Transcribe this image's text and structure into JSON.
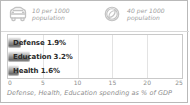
{
  "card": {
    "border_color": "#b9b9b9",
    "background": "#ffffff"
  },
  "legend": {
    "items": [
      {
        "icon": "car-icon",
        "line1": "10 per 1000",
        "line2": "population",
        "value": 10,
        "unit": "per 1000 population"
      },
      {
        "icon": "circle-slash-icon",
        "line1": "40 per 1000",
        "line2": "population",
        "value": 40,
        "unit": "per 1000 population"
      }
    ],
    "text_color": "#9b9b9b"
  },
  "caption": "Defense, Health, Education spending as % of GDP",
  "chart_data": {
    "type": "bar",
    "orientation": "horizontal",
    "title": "",
    "subtitle": "",
    "xlabel": "",
    "ylabel": "",
    "categories": [
      "Defense",
      "Education",
      "Health"
    ],
    "values": [
      1.9,
      3.2,
      1.6
    ],
    "value_suffix": "%",
    "bar_labels": [
      "Defense 1.9%",
      "Education 3.2%",
      "Health 1.6%"
    ],
    "xlim": [
      0,
      25
    ],
    "xticks": [
      0,
      5,
      10,
      15,
      20,
      25
    ],
    "xtick_labels": [
      "0",
      "5",
      "10",
      "15",
      "20",
      "25"
    ],
    "grid": true,
    "gridline_color": "#e3e3e3",
    "legend_position": "top",
    "bar_color": "#8e8e8e",
    "axis_text_color": "#8d8d8d",
    "plot_border_color": "#c9c9c9"
  }
}
